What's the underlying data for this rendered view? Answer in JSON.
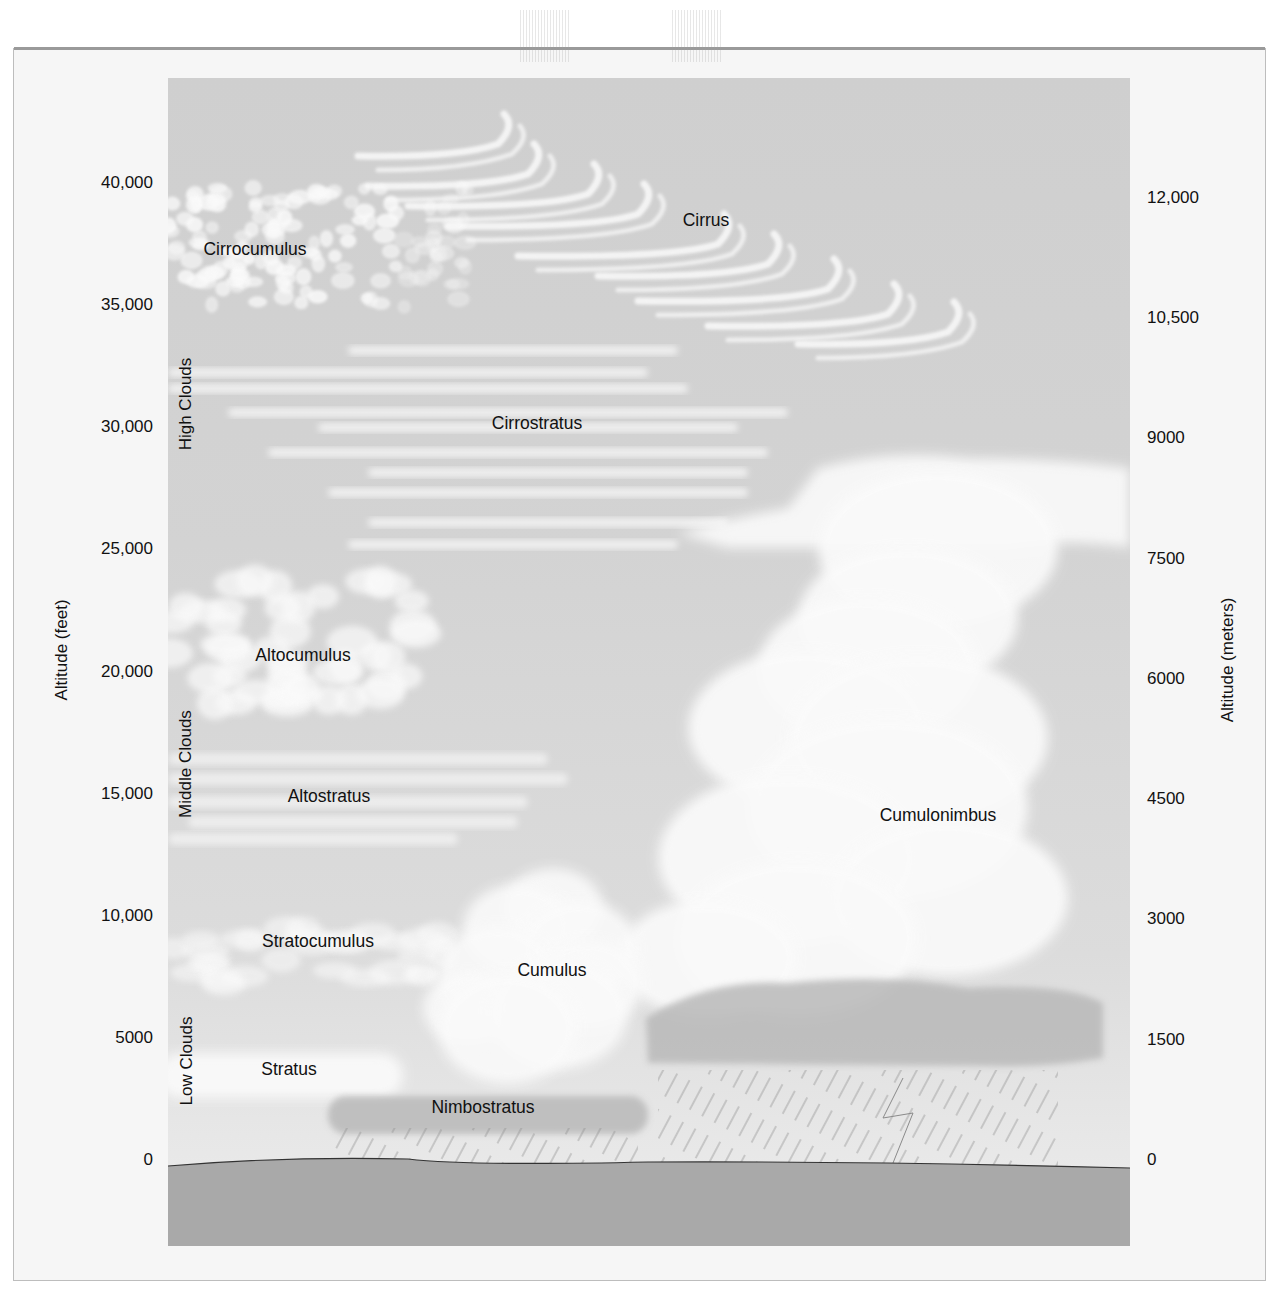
{
  "diagram": {
    "left_axis": {
      "title": "Altitude (feet)",
      "ticks": [
        {
          "value": 40000,
          "label": "40,000"
        },
        {
          "value": 35000,
          "label": "35,000"
        },
        {
          "value": 30000,
          "label": "30,000"
        },
        {
          "value": 25000,
          "label": "25,000"
        },
        {
          "value": 20000,
          "label": "20,000"
        },
        {
          "value": 15000,
          "label": "15,000"
        },
        {
          "value": 10000,
          "label": "10,000"
        },
        {
          "value": 5000,
          "label": "5000"
        },
        {
          "value": 0,
          "label": "0"
        }
      ]
    },
    "right_axis": {
      "title": "Altitude (meters)",
      "ticks": [
        {
          "value": 12000,
          "label": "12,000"
        },
        {
          "value": 10500,
          "label": "10,500"
        },
        {
          "value": 9000,
          "label": "9000"
        },
        {
          "value": 7500,
          "label": "7500"
        },
        {
          "value": 6000,
          "label": "6000"
        },
        {
          "value": 4500,
          "label": "4500"
        },
        {
          "value": 3000,
          "label": "3000"
        },
        {
          "value": 1500,
          "label": "1500"
        },
        {
          "value": 0,
          "label": "0"
        }
      ]
    },
    "bands": [
      {
        "label": "High Clouds"
      },
      {
        "label": "Middle Clouds"
      },
      {
        "label": "Low Clouds"
      }
    ],
    "clouds": [
      {
        "name": "Cirrus",
        "band": "High Clouds",
        "label_altitude_ft": 38800
      },
      {
        "name": "Cirrocumulus",
        "band": "High Clouds",
        "label_altitude_ft": 37600
      },
      {
        "name": "Cirrostratus",
        "band": "High Clouds",
        "label_altitude_ft": 30300
      },
      {
        "name": "Altocumulus",
        "band": "Middle Clouds",
        "label_altitude_ft": 20800
      },
      {
        "name": "Altostratus",
        "band": "Middle Clouds",
        "label_altitude_ft": 15100
      },
      {
        "name": "Cumulonimbus",
        "band": "Vertical development",
        "label_altitude_ft": 14300
      },
      {
        "name": "Stratocumulus",
        "band": "Low Clouds",
        "label_altitude_ft": 9300
      },
      {
        "name": "Cumulus",
        "band": "Vertical development",
        "label_altitude_ft": 8100
      },
      {
        "name": "Stratus",
        "band": "Low Clouds",
        "label_altitude_ft": 3700
      },
      {
        "name": "Nimbostratus",
        "band": "Low Clouds",
        "label_altitude_ft": 2200
      }
    ],
    "colors": {
      "sky_top": "#cfcfcf",
      "sky_bottom": "#ededed",
      "cloud": "#fafafa",
      "dark_cloud_base": "#b9b9b9",
      "ground": "#a9a9a9",
      "rain": "#8a8a8a",
      "text": "#111111"
    }
  }
}
